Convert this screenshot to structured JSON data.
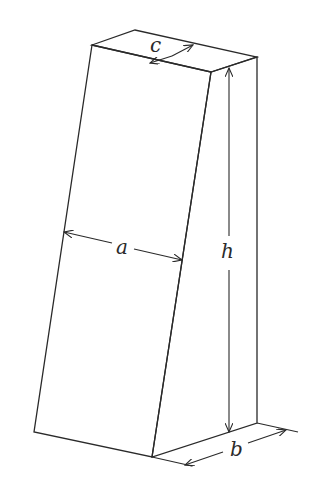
{
  "diagram": {
    "labels": {
      "a": "a",
      "b": "b",
      "c": "c",
      "h": "h"
    },
    "colors": {
      "line": "#2a2a2a",
      "background": "#ffffff"
    }
  }
}
